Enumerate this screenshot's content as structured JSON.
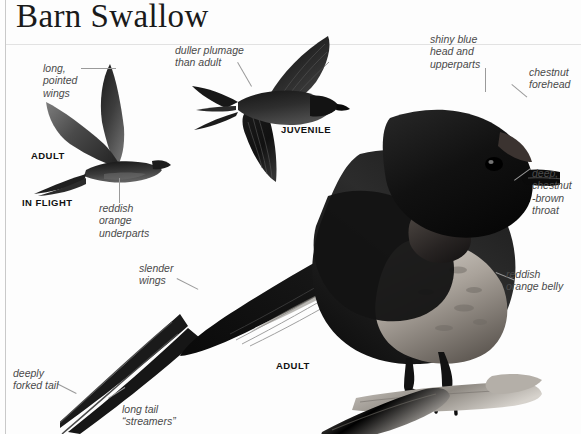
{
  "page": {
    "title": "Barn Swallow",
    "width": 581,
    "height": 434,
    "background": "#fdfdfd",
    "rule_color": "#c9c9c9",
    "ink_color": "#111111",
    "annotation_color": "#4a4a4a",
    "leader_color": "#9a9a9a"
  },
  "figures": [
    {
      "id": "adult-in-flight",
      "caption_primary": "ADULT",
      "caption_secondary": "IN FLIGHT"
    },
    {
      "id": "juvenile-in-flight",
      "caption_primary": "JUVENILE"
    },
    {
      "id": "adult-perched",
      "caption_primary": "ADULT"
    }
  ],
  "captions": {
    "adult_flight": "ADULT",
    "in_flight": "IN FLIGHT",
    "juvenile": "JUVENILE",
    "adult_perched": "ADULT"
  },
  "annotations": [
    {
      "id": "long-pointed-wings",
      "text": "long,\npointed\nwings"
    },
    {
      "id": "reddish-orange-underparts",
      "text": "reddish\norange\nunderparts"
    },
    {
      "id": "duller-plumage-than-adult",
      "text": "duller plumage\nthan adult"
    },
    {
      "id": "shiny-blue-head-and-upperparts",
      "text": "shiny blue\nhead and\nupperparts"
    },
    {
      "id": "chestnut-forehead",
      "text": "chestnut\nforehead"
    },
    {
      "id": "deep-chestnut-brown-throat",
      "text": "deep,\nchestnut\n-brown\nthroat"
    },
    {
      "id": "reddish-orange-belly",
      "text": "reddish\norange belly"
    },
    {
      "id": "slender-wings",
      "text": "slender\nwings"
    },
    {
      "id": "deeply-forked-tail",
      "text": "deeply\nforked tail"
    },
    {
      "id": "long-tail-streamers",
      "text": "long tail\n“streamers”"
    }
  ],
  "annotation_text": {
    "long_pointed_wings": "long,\npointed\nwings",
    "reddish_orange_underparts": "reddish\norange\nunderparts",
    "duller_plumage_than_adult": "duller plumage\nthan adult",
    "shiny_blue_head_and_upperparts": "shiny blue\nhead and\nupperparts",
    "chestnut_forehead": "chestnut\nforehead",
    "deep_chestnut_brown_throat": "deep,\nchestnut\n-brown\nthroat",
    "reddish_orange_belly": "reddish\norange belly",
    "slender_wings": "slender\nwings",
    "deeply_forked_tail": "deeply\nforked tail",
    "long_tail_streamers": "long tail\n“streamers”"
  }
}
